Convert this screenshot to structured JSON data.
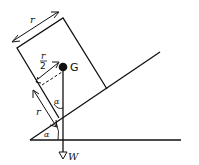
{
  "diagram": {
    "type": "physics-free-body",
    "labels": {
      "block_width": "r",
      "half_width_num": "r",
      "half_width_den": "2",
      "centre_of_mass": "G",
      "lower_distance": "r",
      "angle_top": "α",
      "angle_bottom": "α",
      "weight": "W"
    },
    "colors": {
      "line": "#111111",
      "background": "#ffffff"
    }
  }
}
